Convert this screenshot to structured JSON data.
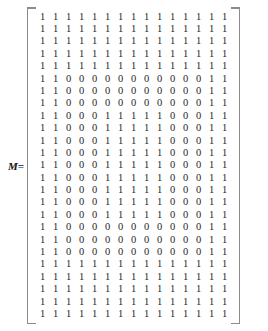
{
  "equation": {
    "label": "M=",
    "label_name": "matrix-variable-M"
  },
  "matrix": {
    "name": "M",
    "rows": 25,
    "cols": 15,
    "open_bracket": "[",
    "close_bracket": "]",
    "colors": {
      "text": "#262626",
      "bracket": "#8b8b8b",
      "background": "#ffffff"
    },
    "values": [
      [
        1,
        1,
        1,
        1,
        1,
        1,
        1,
        1,
        1,
        1,
        1,
        1,
        1,
        1,
        1
      ],
      [
        1,
        1,
        1,
        1,
        1,
        1,
        1,
        1,
        1,
        1,
        1,
        1,
        1,
        1,
        1
      ],
      [
        1,
        1,
        1,
        1,
        1,
        1,
        1,
        1,
        1,
        1,
        1,
        1,
        1,
        1,
        1
      ],
      [
        1,
        1,
        1,
        1,
        1,
        1,
        1,
        1,
        1,
        1,
        1,
        1,
        1,
        1,
        1
      ],
      [
        1,
        1,
        1,
        1,
        1,
        1,
        1,
        1,
        1,
        1,
        1,
        1,
        1,
        1,
        1
      ],
      [
        1,
        1,
        0,
        0,
        0,
        0,
        0,
        0,
        0,
        0,
        0,
        0,
        0,
        1,
        1
      ],
      [
        1,
        1,
        0,
        0,
        0,
        0,
        0,
        0,
        0,
        0,
        0,
        0,
        0,
        1,
        1
      ],
      [
        1,
        1,
        0,
        0,
        0,
        0,
        0,
        0,
        0,
        0,
        0,
        0,
        0,
        1,
        1
      ],
      [
        1,
        1,
        0,
        0,
        0,
        1,
        1,
        1,
        1,
        1,
        0,
        0,
        0,
        1,
        1
      ],
      [
        1,
        1,
        0,
        0,
        0,
        1,
        1,
        1,
        1,
        1,
        0,
        0,
        0,
        1,
        1
      ],
      [
        1,
        1,
        0,
        0,
        0,
        1,
        1,
        1,
        1,
        1,
        0,
        0,
        0,
        1,
        1
      ],
      [
        1,
        1,
        0,
        0,
        0,
        1,
        1,
        1,
        1,
        1,
        0,
        0,
        0,
        1,
        1
      ],
      [
        1,
        1,
        0,
        0,
        0,
        1,
        1,
        1,
        1,
        1,
        0,
        0,
        0,
        1,
        1
      ],
      [
        1,
        1,
        0,
        0,
        0,
        1,
        1,
        1,
        1,
        1,
        0,
        0,
        0,
        1,
        1
      ],
      [
        1,
        1,
        0,
        0,
        0,
        1,
        1,
        1,
        1,
        1,
        0,
        0,
        0,
        1,
        1
      ],
      [
        1,
        1,
        0,
        0,
        0,
        1,
        1,
        1,
        1,
        1,
        0,
        0,
        0,
        1,
        1
      ],
      [
        1,
        1,
        0,
        0,
        0,
        1,
        1,
        1,
        1,
        1,
        0,
        0,
        0,
        1,
        1
      ],
      [
        1,
        1,
        0,
        0,
        0,
        0,
        0,
        0,
        0,
        0,
        0,
        0,
        0,
        1,
        1
      ],
      [
        1,
        1,
        0,
        0,
        0,
        0,
        0,
        0,
        0,
        0,
        0,
        0,
        0,
        1,
        1
      ],
      [
        1,
        1,
        0,
        0,
        0,
        0,
        0,
        0,
        0,
        0,
        0,
        0,
        0,
        1,
        1
      ],
      [
        1,
        1,
        1,
        1,
        1,
        1,
        1,
        1,
        1,
        1,
        1,
        1,
        1,
        1,
        1
      ],
      [
        1,
        1,
        1,
        1,
        1,
        1,
        1,
        1,
        1,
        1,
        1,
        1,
        1,
        1,
        1
      ],
      [
        1,
        1,
        1,
        1,
        1,
        1,
        1,
        1,
        1,
        1,
        1,
        1,
        1,
        1,
        1
      ],
      [
        1,
        1,
        1,
        1,
        1,
        1,
        1,
        1,
        1,
        1,
        1,
        1,
        1,
        1,
        1
      ],
      [
        1,
        1,
        1,
        1,
        1,
        1,
        1,
        1,
        1,
        1,
        1,
        1,
        1,
        1,
        1
      ]
    ]
  }
}
